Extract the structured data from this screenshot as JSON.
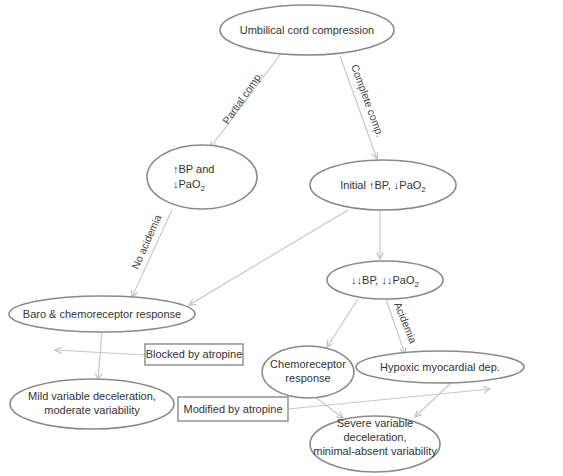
{
  "diagram": {
    "colors": {
      "node_stroke": "#8a8a8a",
      "edge": "#c8c8c8",
      "text": "#333333",
      "background": "#ffffff"
    },
    "nodes": {
      "root": {
        "label": "Umbilical cord compression"
      },
      "partial": {
        "line1": "BP and",
        "line2_prefix": "PaO",
        "line2_sub": "2",
        "arrow_up": "↑",
        "arrow_down": "↓"
      },
      "initial": {
        "prefix": "Initial ",
        "arrow_up": "↑",
        "bp": "BP, ",
        "arrow_down": "↓",
        "pao": "PaO",
        "sub": "2"
      },
      "double_down": {
        "arrows": "↓↓",
        "bp": "BP, ",
        "pao": "PaO",
        "sub": "2"
      },
      "baro": {
        "label": "Baro & chemoreceptor response"
      },
      "chemo": {
        "line1": "Chemoreceptor",
        "line2": "response"
      },
      "hypoxic": {
        "label": "Hypoxic myocardial dep."
      },
      "mild": {
        "line1": "Mild variable deceleration,",
        "line2": "moderate variability"
      },
      "severe": {
        "line1": "Severe variable",
        "line2": "deceleration,",
        "line3": "minimal-absent variability"
      }
    },
    "boxes": {
      "blocked": {
        "label": "Blocked by atropine"
      },
      "modified": {
        "label": "Modified by atropine"
      }
    },
    "edge_labels": {
      "partial": "Partial comp.",
      "complete": "Complete comp.",
      "no_acidemia": "No acidemia",
      "acidemia": "Acidemia"
    }
  }
}
